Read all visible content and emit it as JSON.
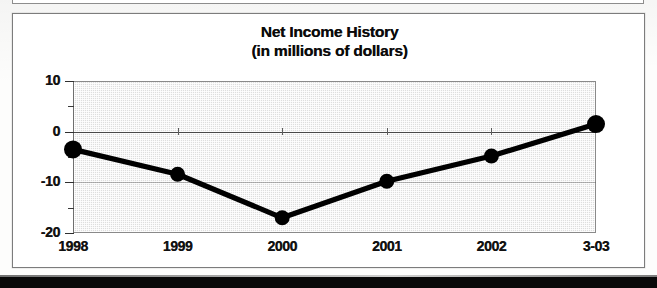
{
  "chart_data": {
    "type": "line",
    "title": "Net Income History",
    "subtitle": "(in millions of dollars)",
    "xlabel": "",
    "ylabel": "",
    "categories": [
      "1998",
      "1999",
      "2000",
      "2001",
      "2002",
      "3-03"
    ],
    "values": [
      -3.5,
      -8.4,
      -17.0,
      -9.8,
      -4.8,
      1.5
    ],
    "series": [
      {
        "name": "Net Income",
        "values": [
          -3.5,
          -8.4,
          -17.0,
          -9.8,
          -4.8,
          1.5
        ]
      }
    ],
    "ylim": [
      -20,
      10
    ],
    "ytick_labels": [
      "10",
      "0",
      "-10",
      "-20"
    ],
    "ytick_values": [
      10,
      0,
      -10,
      -20
    ],
    "yminor_values": [
      5,
      -5,
      -15
    ],
    "grid": true,
    "legend": "none",
    "line_color": "#000000",
    "marker": "circle",
    "marker_color": "#000000",
    "plot_background": "#dedede",
    "frame_color": "#7c7c7c"
  },
  "chart": {
    "title_line1": "Net Income History",
    "title_line2": "(in millions of dollars)"
  }
}
